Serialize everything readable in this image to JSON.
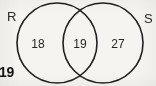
{
  "diagram": {
    "type": "venn-two-set",
    "background_color": "#f6f4f1",
    "stroke_color": "#1f1f1f",
    "text_color": "#262626",
    "sets": [
      {
        "id": "R",
        "label": "R",
        "position": "top-left-outside"
      },
      {
        "id": "S",
        "label": "S",
        "position": "top-right-outside"
      }
    ],
    "regions": [
      {
        "id": "left-only",
        "set": "R only",
        "value": "18"
      },
      {
        "id": "both",
        "set": "R and S overlap",
        "value": "19"
      },
      {
        "id": "right-only",
        "set": "S only",
        "value": "27"
      }
    ]
  },
  "annotations": {
    "margin_note": "19"
  }
}
